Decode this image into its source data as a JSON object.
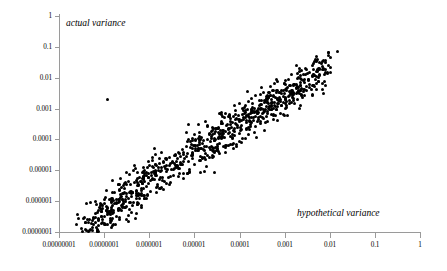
{
  "chart_data": {
    "type": "scatter",
    "title": "",
    "xlabel": "hypothetical variance",
    "ylabel": "actual variance",
    "xscale": "log",
    "yscale": "log",
    "xlim": [
      1e-08,
      1
    ],
    "ylim": [
      1e-07,
      1
    ],
    "grid": false,
    "legend": null,
    "marker": {
      "shape": "circle",
      "color": "#000000",
      "size_px": 3
    },
    "xticks": [
      1e-08,
      1e-07,
      1e-06,
      1e-05,
      0.0001,
      0.001,
      0.01,
      0.1,
      1
    ],
    "xtick_labels": [
      "0.00000001",
      "0.0000001",
      "0.000001",
      "0.00001",
      "0.0001",
      "0.001",
      "0.01",
      "0.1",
      "1"
    ],
    "yticks": [
      1,
      0.1,
      0.01,
      0.001,
      0.0001,
      1e-05,
      1e-06,
      1e-07
    ],
    "ytick_labels": [
      "1",
      "0.1",
      "0.01",
      "0.001",
      "0.0001",
      "0.00001",
      "0.000001",
      "0.0000001"
    ],
    "annotations": [
      {
        "text": "actual variance",
        "position": "top-left-inside",
        "style": "italic"
      },
      {
        "text": "hypothetical variance",
        "position": "bottom-right-inside",
        "style": "italic"
      }
    ],
    "n_points": 920,
    "outliers": [
      {
        "x": 1.2e-07,
        "y": 0.002
      }
    ],
    "points": [
      [
        3.2e-08,
        8e-08
      ],
      [
        3.6e-08,
        5e-08
      ],
      [
        4e-08,
        1.1e-07
      ],
      [
        4.4e-08,
        7e-08
      ],
      [
        4.8e-08,
        1.5e-07
      ],
      [
        5.2e-08,
        9e-08
      ],
      [
        5.6e-08,
        2e-07
      ],
      [
        6e-08,
        1.2e-07
      ],
      [
        6.5e-08,
        2.6e-07
      ],
      [
        7e-08,
        1.6e-07
      ],
      [
        7.6e-08,
        3.2e-07
      ],
      [
        8.2e-08,
        2e-07
      ],
      [
        9e-08,
        4e-07
      ],
      [
        9.8e-08,
        2.5e-07
      ],
      [
        1.05e-07,
        5e-07
      ],
      [
        1.15e-07,
        3.2e-07
      ],
      [
        1.25e-07,
        6e-07
      ],
      [
        1.35e-07,
        4e-07
      ],
      [
        1.45e-07,
        7.5e-07
      ],
      [
        1.6e-07,
        5e-07
      ],
      [
        1.75e-07,
        9e-07
      ],
      [
        1.9e-07,
        6e-07
      ],
      [
        2.1e-07,
        1.1e-06
      ],
      [
        2.3e-07,
        7.5e-07
      ],
      [
        2.5e-07,
        1.4e-06
      ],
      [
        2.7e-07,
        9e-07
      ],
      [
        3e-07,
        1.7e-06
      ],
      [
        3.3e-07,
        1.1e-06
      ],
      [
        3.6e-07,
        2e-06
      ],
      [
        4e-07,
        1.4e-06
      ],
      [
        4.4e-07,
        2.5e-06
      ],
      [
        4.8e-07,
        1.7e-06
      ],
      [
        5.3e-07,
        3e-06
      ],
      [
        5.8e-07,
        2e-06
      ],
      [
        6.4e-07,
        3.6e-06
      ],
      [
        7e-07,
        2.5e-06
      ],
      [
        7.7e-07,
        4.4e-06
      ],
      [
        8.5e-07,
        3e-06
      ],
      [
        9.3e-07,
        5.2e-06
      ],
      [
        1e-06,
        3.6e-06
      ],
      [
        1.1e-06,
        6.2e-06
      ],
      [
        1.2e-06,
        4.4e-06
      ],
      [
        1.35e-06,
        7.5e-06
      ],
      [
        1.5e-06,
        5.2e-06
      ],
      [
        1.65e-06,
        9e-06
      ],
      [
        1.8e-06,
        6.2e-06
      ],
      [
        2e-06,
        1.1e-05
      ],
      [
        2.2e-06,
        7.5e-06
      ],
      [
        2.4e-06,
        1.3e-05
      ],
      [
        2.7e-06,
        9e-06
      ],
      [
        3e-06,
        1.6e-05
      ],
      [
        3.3e-06,
        1.1e-05
      ],
      [
        3.6e-06,
        1.9e-05
      ],
      [
        4e-06,
        1.3e-05
      ],
      [
        4.4e-06,
        2.3e-05
      ],
      [
        4.9e-06,
        1.6e-05
      ],
      [
        5.4e-06,
        2.8e-05
      ],
      [
        6e-06,
        1.9e-05
      ],
      [
        6.6e-06,
        3.3e-05
      ],
      [
        7.3e-06,
        2.3e-05
      ],
      [
        8e-06,
        4e-05
      ],
      [
        8.8e-06,
        2.8e-05
      ],
      [
        9.7e-06,
        4.8e-05
      ],
      [
        1.07e-05,
        3.3e-05
      ],
      [
        1.18e-05,
        5.7e-05
      ],
      [
        1.3e-05,
        4e-05
      ],
      [
        1.43e-05,
        6.8e-05
      ],
      [
        1.58e-05,
        4.8e-05
      ],
      [
        1.74e-05,
        8.2e-05
      ],
      [
        1.9e-05,
        5.7e-05
      ],
      [
        2.1e-05,
        9.8e-05
      ],
      [
        2.3e-05,
        6.8e-05
      ],
      [
        2.5e-05,
        0.000117
      ],
      [
        2.8e-05,
        8.2e-05
      ],
      [
        3.1e-05,
        0.00014
      ],
      [
        3.4e-05,
        9.8e-05
      ],
      [
        3.7e-05,
        0.000167
      ],
      [
        4.1e-05,
        0.000117
      ],
      [
        4.5e-05,
        0.0002
      ],
      [
        5e-05,
        0.00014
      ],
      [
        5.5e-05,
        0.00024
      ],
      [
        6e-05,
        0.000167
      ],
      [
        6.6e-05,
        0.000285
      ],
      [
        7.3e-05,
        0.0002
      ],
      [
        8e-05,
        0.00034
      ],
      [
        8.8e-05,
        0.00024
      ],
      [
        9.7e-05,
        0.00041
      ],
      [
        0.000107,
        0.000285
      ],
      [
        0.000118,
        0.00049
      ],
      [
        0.00013,
        0.00034
      ],
      [
        0.000143,
        0.00058
      ],
      [
        0.000157,
        0.00041
      ],
      [
        0.000173,
        0.0007
      ],
      [
        0.00019,
        0.00049
      ],
      [
        0.00021,
        0.00083
      ],
      [
        0.00023,
        0.00058
      ],
      [
        0.00025,
        0.001
      ],
      [
        0.00028,
        0.0007
      ],
      [
        0.00031,
        0.0012
      ],
      [
        0.00034,
        0.00083
      ],
      [
        0.00037,
        0.0014
      ],
      [
        0.00041,
        0.001
      ],
      [
        0.00045,
        0.0017
      ],
      [
        0.0005,
        0.0012
      ],
      [
        0.00055,
        0.002
      ],
      [
        0.0006,
        0.0014
      ],
      [
        0.00066,
        0.0024
      ],
      [
        0.00073,
        0.0017
      ],
      [
        0.0008,
        0.0029
      ],
      [
        0.00088,
        0.002
      ],
      [
        0.00097,
        0.0034
      ],
      [
        0.00107,
        0.0024
      ],
      [
        0.00118,
        0.0041
      ],
      [
        0.0013,
        0.0029
      ],
      [
        0.00143,
        0.0049
      ],
      [
        0.00157,
        0.0034
      ],
      [
        0.00173,
        0.0058
      ],
      [
        0.0019,
        0.0041
      ],
      [
        0.0021,
        0.007
      ],
      [
        0.0023,
        0.0049
      ],
      [
        0.0025,
        0.0083
      ],
      [
        0.0028,
        0.0058
      ],
      [
        0.0031,
        0.01
      ],
      [
        0.0034,
        0.007
      ],
      [
        0.0037,
        0.012
      ],
      [
        0.0041,
        0.0083
      ],
      [
        0.0045,
        0.0145
      ],
      [
        0.005,
        0.01
      ],
      [
        0.0055,
        0.017
      ],
      [
        0.006,
        0.012
      ],
      [
        0.0066,
        0.02
      ],
      [
        0.0073,
        0.0145
      ],
      [
        0.008,
        0.024
      ],
      [
        0.0088,
        0.017
      ],
      [
        0.0097,
        0.029
      ]
    ]
  },
  "axes": {
    "x_title": "hypothetical variance",
    "y_title": "actual variance"
  }
}
